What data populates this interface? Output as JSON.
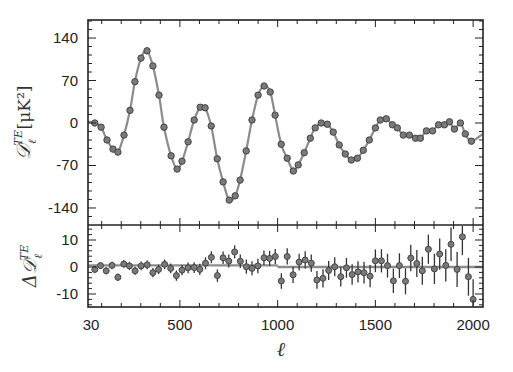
{
  "chart_data": [
    {
      "panel": "top",
      "type": "scatter",
      "title": "",
      "ylabel": "D_ℓ^TE [μK²]",
      "ylabel_parts": {
        "main": "𝒟",
        "sub": "ℓ",
        "sup": "TE",
        "unit": "[μK²]"
      },
      "xlabel": "",
      "xlim": [
        2,
        2050
      ],
      "ylim": [
        -170,
        168
      ],
      "yticks": [
        140,
        70,
        0,
        -70,
        -140
      ],
      "ytick_labels": [
        "140",
        "70",
        "0",
        "-70",
        "-140"
      ],
      "grid": false,
      "legend": [],
      "series": [
        {
          "name": "Planck TE data (binned)",
          "marker": "circle",
          "color": "#7a7a7a",
          "points": [
            [
              65,
              0
            ],
            [
              97,
              -7
            ],
            [
              127,
              -28
            ],
            [
              158,
              -43
            ],
            [
              183,
              -48
            ],
            [
              214,
              -20
            ],
            [
              245,
              21
            ],
            [
              270,
              68
            ],
            [
              301,
              107
            ],
            [
              332,
              119
            ],
            [
              362,
              94
            ],
            [
              393,
              46
            ],
            [
              419,
              -7
            ],
            [
              455,
              -54
            ],
            [
              486,
              -76
            ],
            [
              511,
              -63
            ],
            [
              542,
              -31
            ],
            [
              573,
              5
            ],
            [
              604,
              26
            ],
            [
              629,
              25
            ],
            [
              660,
              -5
            ],
            [
              691,
              -59
            ],
            [
              721,
              -97
            ],
            [
              752,
              -127
            ],
            [
              783,
              -120
            ],
            [
              808,
              -94
            ],
            [
              839,
              -46
            ],
            [
              869,
              5
            ],
            [
              900,
              46
            ],
            [
              931,
              61
            ],
            [
              962,
              51
            ],
            [
              987,
              13
            ],
            [
              1018,
              -35
            ],
            [
              1049,
              -58
            ],
            [
              1080,
              -79
            ],
            [
              1105,
              -69
            ],
            [
              1136,
              -49
            ],
            [
              1167,
              -25
            ],
            [
              1192,
              -8
            ],
            [
              1223,
              0
            ],
            [
              1254,
              -2
            ],
            [
              1284,
              -15
            ],
            [
              1315,
              -36
            ],
            [
              1346,
              -51
            ],
            [
              1377,
              -61
            ],
            [
              1408,
              -58
            ],
            [
              1438,
              -45
            ],
            [
              1469,
              -28
            ],
            [
              1500,
              -8
            ],
            [
              1525,
              5
            ],
            [
              1556,
              7
            ],
            [
              1587,
              -3
            ],
            [
              1612,
              -8
            ],
            [
              1643,
              -20
            ],
            [
              1674,
              -20
            ],
            [
              1705,
              -25
            ],
            [
              1730,
              -25
            ],
            [
              1761,
              -13
            ],
            [
              1792,
              -13
            ],
            [
              1823,
              -3
            ],
            [
              1853,
              -3
            ],
            [
              1879,
              2
            ],
            [
              1904,
              -10
            ],
            [
              1935,
              0
            ],
            [
              1960,
              -18
            ],
            [
              1991,
              -30
            ]
          ]
        },
        {
          "name": "Best-fit ΛCDM model",
          "type": "line",
          "color": "#8c8c8c"
        }
      ]
    },
    {
      "panel": "bottom",
      "type": "scatter",
      "title": "",
      "ylabel": "ΔD_ℓ^TE",
      "ylabel_parts": {
        "main": "Δ𝒟",
        "sub": "ℓ",
        "sup": "TE"
      },
      "xlabel": "ℓ",
      "xlim": [
        2,
        2050
      ],
      "ylim": [
        -15,
        15
      ],
      "xticks": [
        30,
        500,
        1000,
        1500,
        2000
      ],
      "xtick_labels": [
        "30",
        "500",
        "1000",
        "1500",
        "2000"
      ],
      "yticks": [
        10,
        0,
        -10
      ],
      "ytick_labels": [
        "10",
        "0",
        "-10"
      ],
      "grid": false,
      "series": [
        {
          "name": "Residuals",
          "marker": "circle",
          "color": "#7a7a7a",
          "points_with_err": [
            [
              65,
              -0.9,
              1.2
            ],
            [
              94,
              0.5,
              1.2
            ],
            [
              123,
              -1.4,
              1.3
            ],
            [
              153,
              0.6,
              1.3
            ],
            [
              183,
              -3.8,
              1.4
            ],
            [
              213,
              1.1,
              1.4
            ],
            [
              242,
              0.4,
              1.5
            ],
            [
              271,
              -1.4,
              1.5
            ],
            [
              302,
              0.4,
              1.6
            ],
            [
              333,
              0.8,
              1.6
            ],
            [
              362,
              -2.1,
              1.7
            ],
            [
              391,
              -0.9,
              1.7
            ],
            [
              422,
              1.0,
              1.8
            ],
            [
              453,
              -0.5,
              1.8
            ],
            [
              482,
              -3.2,
              1.9
            ],
            [
              511,
              -1.2,
              1.9
            ],
            [
              542,
              -0.3,
              2.0
            ],
            [
              573,
              -0.2,
              2.0
            ],
            [
              602,
              -0.9,
              2.1
            ],
            [
              631,
              1.4,
              2.2
            ],
            [
              661,
              3.6,
              2.2
            ],
            [
              692,
              -3.2,
              2.3
            ],
            [
              721,
              3.4,
              2.3
            ],
            [
              750,
              2.2,
              2.4
            ],
            [
              780,
              5.6,
              2.4
            ],
            [
              809,
              2.1,
              2.5
            ],
            [
              840,
              0.1,
              2.6
            ],
            [
              869,
              -0.5,
              2.6
            ],
            [
              899,
              0.4,
              2.7
            ],
            [
              930,
              3.4,
              2.7
            ],
            [
              959,
              3.2,
              2.8
            ],
            [
              988,
              3.9,
              2.8
            ],
            [
              1019,
              -5.2,
              2.9
            ],
            [
              1049,
              3.9,
              3.0
            ],
            [
              1079,
              -2.9,
              3.0
            ],
            [
              1110,
              1.8,
              3.1
            ],
            [
              1141,
              2.6,
              3.2
            ],
            [
              1172,
              1.4,
              3.2
            ],
            [
              1201,
              -4.8,
              3.3
            ],
            [
              1232,
              -4.2,
              3.4
            ],
            [
              1261,
              -1.3,
              3.5
            ],
            [
              1292,
              0.1,
              3.5
            ],
            [
              1323,
              -3.6,
              3.6
            ],
            [
              1352,
              -0.3,
              3.7
            ],
            [
              1381,
              -2.8,
              3.8
            ],
            [
              1411,
              -1.8,
              3.9
            ],
            [
              1442,
              -2.1,
              4.0
            ],
            [
              1473,
              -3.4,
              4.1
            ],
            [
              1500,
              2.3,
              4.2
            ],
            [
              1531,
              2.3,
              4.3
            ],
            [
              1562,
              0.5,
              4.4
            ],
            [
              1592,
              -5.1,
              4.5
            ],
            [
              1623,
              0.5,
              4.6
            ],
            [
              1654,
              -5.3,
              4.8
            ],
            [
              1681,
              3.3,
              4.9
            ],
            [
              1712,
              1.3,
              5.0
            ],
            [
              1740,
              -1.4,
              5.2
            ],
            [
              1771,
              6.6,
              5.4
            ],
            [
              1802,
              -0.7,
              5.6
            ],
            [
              1829,
              4.8,
              5.8
            ],
            [
              1860,
              0.6,
              6.0
            ],
            [
              1887,
              8.4,
              6.2
            ],
            [
              1918,
              -0.9,
              6.5
            ],
            [
              1945,
              11.2,
              6.8
            ],
            [
              1976,
              -3.6,
              7.0
            ],
            [
              2000,
              -12.0,
              7.5
            ]
          ]
        },
        {
          "name": "Zero line / model difference",
          "type": "line",
          "color": "#8c8c8c",
          "segments": [
            {
              "from": 30,
              "to": 1000,
              "value": 0.6
            },
            {
              "from": 1000,
              "to": 2050,
              "value": 0.0
            }
          ]
        }
      ]
    }
  ],
  "labels": {
    "x_axis_title": "ℓ",
    "top_ylabel_main": "𝒟",
    "top_ylabel_sup": "TE",
    "top_ylabel_sub": "ℓ",
    "top_ylabel_unit": "[μK²]",
    "bottom_ylabel_main": "Δ𝒟",
    "bottom_ylabel_sup": "TE",
    "bottom_ylabel_sub": "ℓ"
  }
}
